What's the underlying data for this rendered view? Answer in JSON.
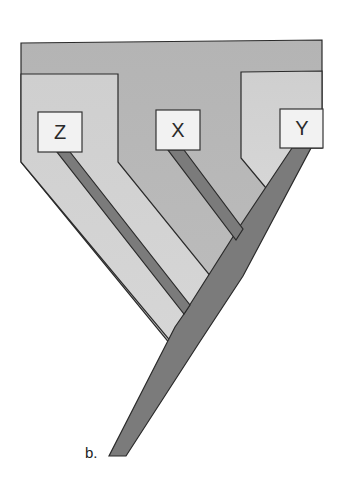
{
  "diagram": {
    "type": "cladogram",
    "panel_label": "b.",
    "taxa": [
      {
        "id": "Z",
        "label": "Z"
      },
      {
        "id": "X",
        "label": "X"
      },
      {
        "id": "Y",
        "label": "Y"
      }
    ],
    "topology": "(Z,(X,Y))",
    "colors": {
      "outer_region": "#b6b6b6",
      "inner_region": "#cdcdcd",
      "branch": "#7b7b7b",
      "box": "#f2f2f2",
      "outline": "#2a2a2a"
    }
  }
}
